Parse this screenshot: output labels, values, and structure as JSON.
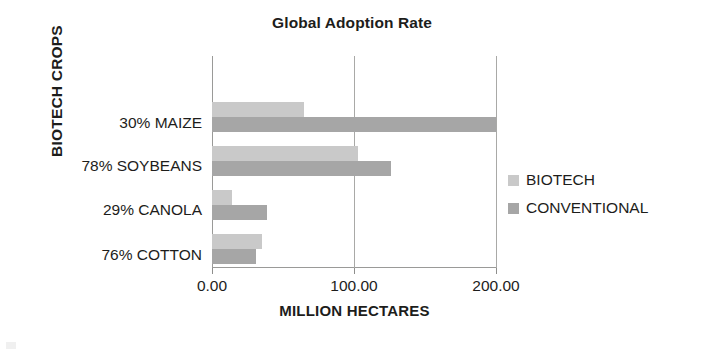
{
  "chart_data": {
    "type": "bar",
    "orientation": "horizontal",
    "title": "Global Adoption Rate",
    "xlabel": "MILLION HECTARES",
    "ylabel": "BIOTECH CROPS",
    "categories": [
      "30% MAIZE",
      "78% SOYBEANS",
      "29% CANOLA",
      "76% COTTON"
    ],
    "series": [
      {
        "name": "BIOTECH",
        "color": "#c9c9c9",
        "values": [
          65,
          103,
          14,
          35
        ]
      },
      {
        "name": "CONVENTIONAL",
        "color": "#a6a6a6",
        "values": [
          200,
          126,
          39,
          31
        ]
      }
    ],
    "xlim": [
      0,
      200
    ],
    "xticks": [
      0,
      100,
      200
    ],
    "xtick_labels": [
      "0.00",
      "100.00",
      "200.00"
    ],
    "grid": true,
    "legend_position": "right"
  },
  "legend": {
    "items": [
      {
        "label": "BIOTECH"
      },
      {
        "label": "CONVENTIONAL"
      }
    ]
  }
}
